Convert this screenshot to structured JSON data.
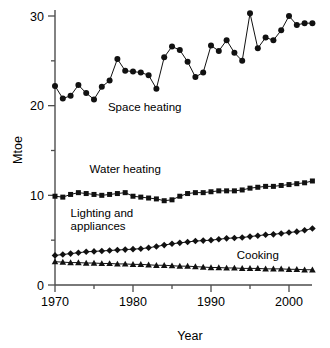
{
  "chart_data": {
    "type": "line",
    "title": "",
    "xlabel": "Year",
    "ylabel": "Mtoe",
    "xlim": [
      1970,
      2003
    ],
    "ylim": [
      0,
      31
    ],
    "grid": false,
    "legend_position": "inline-annotations",
    "x": [
      1970,
      1971,
      1972,
      1973,
      1974,
      1975,
      1976,
      1977,
      1978,
      1979,
      1980,
      1981,
      1982,
      1983,
      1984,
      1985,
      1986,
      1987,
      1988,
      1989,
      1990,
      1991,
      1992,
      1993,
      1994,
      1995,
      1996,
      1997,
      1998,
      1999,
      2000,
      2001,
      2002,
      2003
    ],
    "x_ticks": [
      1970,
      1980,
      1990,
      2000
    ],
    "x_tick_labels": [
      "1970",
      "1980",
      "1990",
      "2000"
    ],
    "x_minor_ticks": [
      1975,
      1985,
      1995
    ],
    "y_ticks": [
      0,
      10,
      20,
      30
    ],
    "y_tick_labels": [
      "0",
      "10",
      "20",
      "30"
    ],
    "y_minor_ticks": [
      5,
      15,
      25
    ],
    "series": [
      {
        "name": "Space heating",
        "marker": "circle",
        "label_x": 1981.5,
        "label_y": 19.4,
        "values": [
          22.2,
          20.8,
          21.1,
          22.3,
          21.4,
          20.7,
          22.1,
          22.8,
          25.2,
          23.9,
          23.8,
          23.7,
          23.4,
          21.9,
          25.4,
          26.6,
          26.2,
          24.9,
          23.2,
          23.7,
          26.7,
          26.1,
          27.3,
          25.9,
          25.0,
          30.3,
          26.4,
          27.6,
          27.3,
          28.4,
          30.0,
          29.0,
          29.2,
          29.2
        ]
      },
      {
        "name": "Water heating",
        "marker": "square",
        "label_x": 1979.0,
        "label_y": 12.5,
        "values": [
          9.9,
          9.8,
          10.1,
          10.3,
          10.2,
          10.1,
          10.0,
          10.1,
          10.2,
          10.3,
          9.9,
          9.8,
          9.7,
          9.6,
          9.4,
          9.5,
          9.9,
          10.2,
          10.3,
          10.3,
          10.4,
          10.5,
          10.5,
          10.5,
          10.6,
          10.8,
          10.9,
          11.0,
          11.0,
          11.1,
          11.2,
          11.3,
          11.4,
          11.6
        ]
      },
      {
        "name": "Lighting and appliances",
        "marker": "diamond",
        "label_x": 1972.0,
        "label_y": 7.6,
        "values": [
          3.3,
          3.4,
          3.5,
          3.6,
          3.7,
          3.75,
          3.8,
          3.85,
          3.9,
          3.95,
          4.0,
          4.05,
          4.15,
          4.3,
          4.45,
          4.6,
          4.7,
          4.8,
          4.9,
          4.95,
          5.0,
          5.1,
          5.2,
          5.25,
          5.3,
          5.4,
          5.5,
          5.6,
          5.65,
          5.75,
          5.85,
          5.95,
          6.1,
          6.3
        ]
      },
      {
        "name": "Cooking",
        "marker": "triangle",
        "label_x": 1996.0,
        "label_y": 2.9,
        "values": [
          2.6,
          2.55,
          2.5,
          2.5,
          2.45,
          2.45,
          2.4,
          2.4,
          2.35,
          2.35,
          2.3,
          2.3,
          2.25,
          2.2,
          2.2,
          2.15,
          2.1,
          2.1,
          2.05,
          2.0,
          1.95,
          1.95,
          1.9,
          1.9,
          1.85,
          1.85,
          1.85,
          1.8,
          1.8,
          1.8,
          1.75,
          1.75,
          1.7,
          1.7
        ]
      }
    ]
  },
  "colors": {
    "marker": "#111111",
    "line": "#111111",
    "axis": "#4d4d4d",
    "text": "#000000",
    "background": "#ffffff"
  }
}
